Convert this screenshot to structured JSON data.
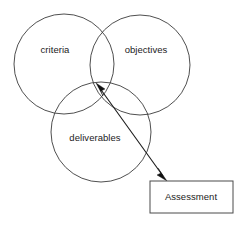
{
  "diagram": {
    "type": "venn-with-callout",
    "title": "",
    "canvas": {
      "width": 245,
      "height": 228,
      "background": "#ffffff"
    },
    "stroke_color": "#3b3b3b",
    "arrow_color": "#111111",
    "text_color": "#1b1b1b",
    "circles": [
      {
        "id": "criteria",
        "label": "criteria",
        "cx": 64,
        "cy": 64,
        "r": 50,
        "label_x": 55,
        "label_y": 50
      },
      {
        "id": "objectives",
        "label": "objectives",
        "cx": 140,
        "cy": 65,
        "r": 50,
        "label_x": 146,
        "label_y": 50
      },
      {
        "id": "deliverables",
        "label": "deliverables",
        "cx": 101,
        "cy": 132,
        "r": 50,
        "label_x": 95,
        "label_y": 138
      }
    ],
    "box": {
      "id": "assessment",
      "label": "Assessment",
      "x": 150,
      "y": 181,
      "width": 83,
      "height": 32,
      "label_x": 191,
      "label_y": 197
    },
    "connector": {
      "id": "assessment-connector",
      "style": "double-headed-arrow",
      "from_x": 97,
      "from_y": 85,
      "to_x": 165,
      "to_y": 178,
      "description": "double-headed arrow linking the triple intersection of the three circles to the Assessment box"
    }
  }
}
